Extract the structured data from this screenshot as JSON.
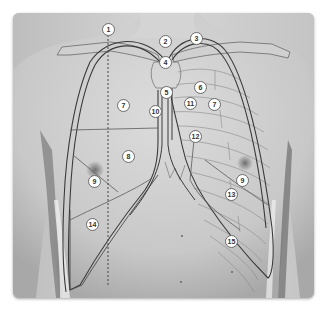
{
  "figure": {
    "colors": {
      "background": "#ffffff",
      "backdrop": "#cfcfcf",
      "skin_light": "#d8d8d8",
      "skin_shadow": "#8c8c8c",
      "outline": "#3a3a3a",
      "thin_line": "#6a6a6a",
      "label_fill": "#ffffff"
    },
    "labels": [
      {
        "id": "1",
        "x": 108,
        "y": 29
      },
      {
        "id": "2",
        "x": 165,
        "y": 41
      },
      {
        "id": "3",
        "x": 196,
        "y": 38
      },
      {
        "id": "4",
        "x": 165,
        "y": 62
      },
      {
        "id": "5",
        "x": 166,
        "y": 92
      },
      {
        "id": "6",
        "x": 200,
        "y": 87
      },
      {
        "id": "7",
        "x": 123,
        "y": 105
      },
      {
        "id": "10",
        "x": 155,
        "y": 111
      },
      {
        "id": "11",
        "x": 190,
        "y": 103
      },
      {
        "id": "7",
        "x": 214,
        "y": 104
      },
      {
        "id": "12",
        "x": 195,
        "y": 136
      },
      {
        "id": "8",
        "x": 128,
        "y": 156
      },
      {
        "id": "9",
        "x": 94,
        "y": 181
      },
      {
        "id": "9",
        "x": 242,
        "y": 180
      },
      {
        "id": "13",
        "x": 231,
        "y": 194
      },
      {
        "id": "14",
        "x": 92,
        "y": 224
      },
      {
        "id": "15",
        "x": 231,
        "y": 241
      }
    ]
  }
}
